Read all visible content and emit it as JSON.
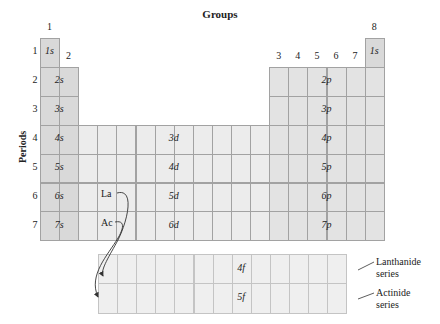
{
  "title": "Groups",
  "axis_label_periods": "Periods",
  "group_labels": [
    {
      "label": "1",
      "col": 0
    },
    {
      "label": "2",
      "col": 1
    },
    {
      "label": "3",
      "col": 12
    },
    {
      "label": "4",
      "col": 13
    },
    {
      "label": "5",
      "col": 14
    },
    {
      "label": "6",
      "col": 15
    },
    {
      "label": "7",
      "col": 16
    },
    {
      "label": "8",
      "col": 17
    }
  ],
  "period_labels": [
    "1",
    "2",
    "3",
    "4",
    "5",
    "6",
    "7"
  ],
  "blocks": {
    "s": [
      "1s",
      "2s",
      "3s",
      "4s",
      "5s",
      "6s",
      "7s"
    ],
    "s_he": "1s",
    "p": [
      "2p",
      "3p",
      "4p",
      "5p",
      "6p",
      "7p"
    ],
    "d": [
      "3d",
      "4d",
      "5d",
      "6d"
    ],
    "f": [
      "4f",
      "5f"
    ]
  },
  "elements": {
    "la": "La",
    "ac": "Ac"
  },
  "series": {
    "lanthanide_line1": "Lanthanide",
    "lanthanide_line2": "series",
    "actinide_line1": "Actinide",
    "actinide_line2": "series"
  },
  "colors": {
    "s_block": "#d9d9d9",
    "p_block": "#e3e3e3",
    "d_block": "#ececec",
    "f_block": "#efefef",
    "grid": "#a2a2a2"
  }
}
